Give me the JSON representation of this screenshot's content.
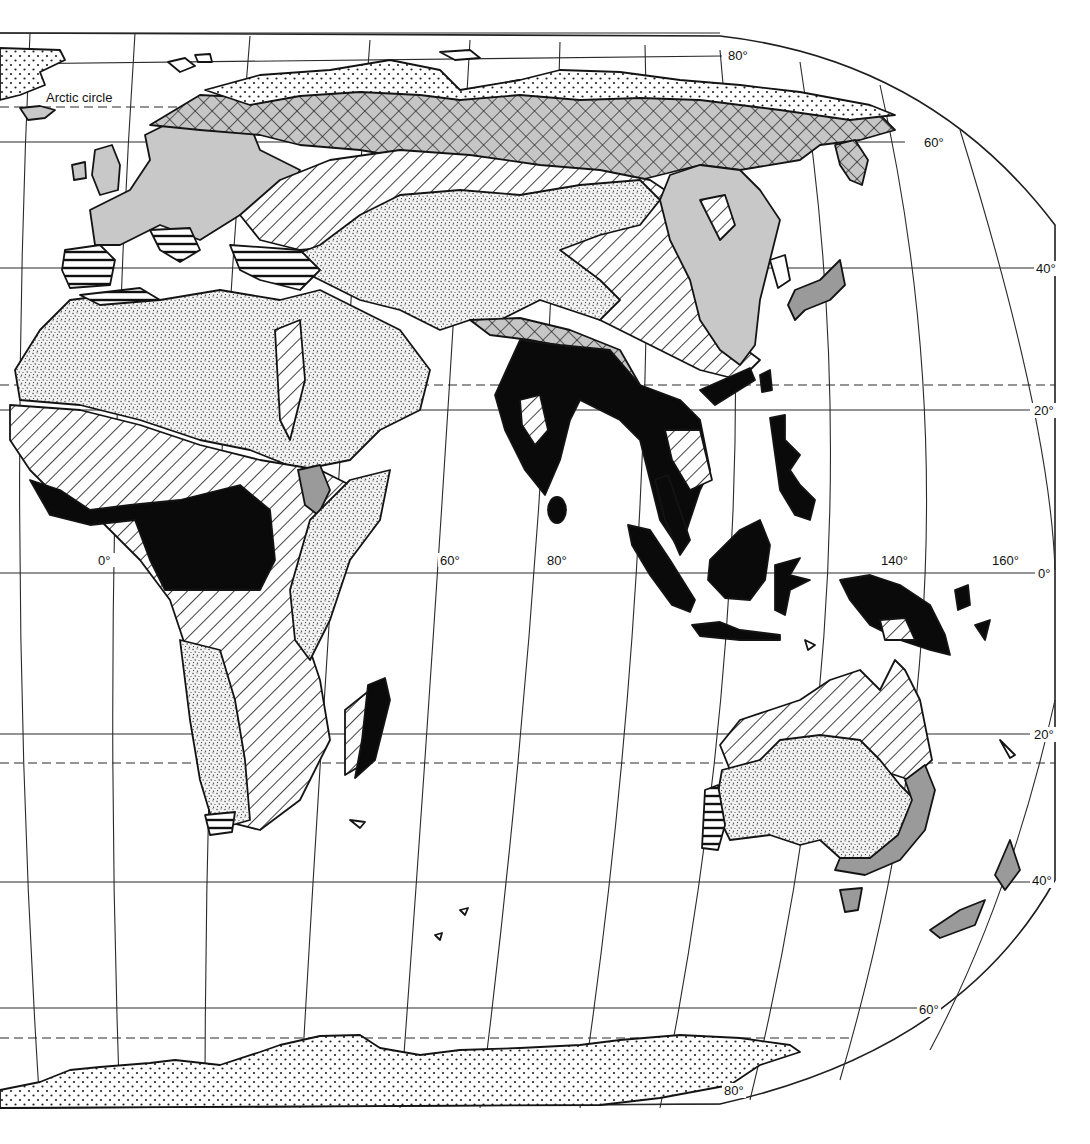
{
  "map": {
    "projection": "world map, Eastern Hemisphere (Europe, Africa, Asia, Australia, Antarctica)",
    "colors": {
      "background": "#ffffff",
      "line": "#141414",
      "light_gray": "#c8c8c8",
      "mid_gray": "#9a9a9a",
      "black": "#0a0a0a"
    },
    "special_lines": {
      "arctic_circle_label": "Arctic circle"
    },
    "longitude_labels": [
      {
        "text": "0°",
        "x": 106,
        "y": 566
      },
      {
        "text": "60°",
        "x": 450,
        "y": 566
      },
      {
        "text": "80°",
        "x": 556,
        "y": 566
      },
      {
        "text": "140°",
        "x": 893,
        "y": 566
      },
      {
        "text": "160°",
        "x": 1002,
        "y": 566
      }
    ],
    "latitude_labels": [
      {
        "text": "80°",
        "x": 738,
        "y": 60
      },
      {
        "text": "60°",
        "x": 934,
        "y": 146
      },
      {
        "text": "40°",
        "x": 1046,
        "y": 273
      },
      {
        "text": "20°",
        "x": 1044,
        "y": 415
      },
      {
        "text": "0°",
        "x": 1045,
        "y": 579
      },
      {
        "text": "20°",
        "x": 1044,
        "y": 740
      },
      {
        "text": "40°",
        "x": 1042,
        "y": 885
      },
      {
        "text": "60°",
        "x": 929,
        "y": 1014
      },
      {
        "text": "80°",
        "x": 735,
        "y": 1094
      }
    ],
    "regions": [
      {
        "name": "Antarctica",
        "fill": "sparse-dots"
      },
      {
        "name": "Arctic Siberia",
        "fill": "sparse-dots"
      },
      {
        "name": "Greenland",
        "fill": "sparse-dots"
      },
      {
        "name": "Siberian taiga",
        "fill": "crosshatch-gray"
      },
      {
        "name": "Europe / East Asia forest",
        "fill": "light-gray"
      },
      {
        "name": "Central Asian steppe",
        "fill": "diagonal-hatch"
      },
      {
        "name": "Central Asian desert",
        "fill": "fine-stipple"
      },
      {
        "name": "Sahara / Arabia",
        "fill": "fine-stipple"
      },
      {
        "name": "Mediterranean",
        "fill": "horizontal-hatch"
      },
      {
        "name": "African savanna",
        "fill": "diagonal-hatch"
      },
      {
        "name": "African rainforest",
        "fill": "black"
      },
      {
        "name": "Ethiopian highlands",
        "fill": "mid-gray"
      },
      {
        "name": "East Africa",
        "fill": "fine-stipple"
      },
      {
        "name": "Kalahari / Namib",
        "fill": "fine-stipple"
      },
      {
        "name": "Madagascar east",
        "fill": "black"
      },
      {
        "name": "India / Southeast Asia forest",
        "fill": "black"
      },
      {
        "name": "Himalaya",
        "fill": "crosshatch-gray"
      },
      {
        "name": "Indonesia / New Guinea",
        "fill": "black"
      },
      {
        "name": "Japan",
        "fill": "mid-gray"
      },
      {
        "name": "Northern Australia",
        "fill": "diagonal-hatch"
      },
      {
        "name": "Australian desert",
        "fill": "fine-stipple"
      },
      {
        "name": "Eastern Australia",
        "fill": "mid-gray"
      },
      {
        "name": "SW Australia",
        "fill": "horizontal-hatch"
      },
      {
        "name": "New Zealand",
        "fill": "mid-gray"
      },
      {
        "name": "Tasmania",
        "fill": "mid-gray"
      }
    ]
  }
}
